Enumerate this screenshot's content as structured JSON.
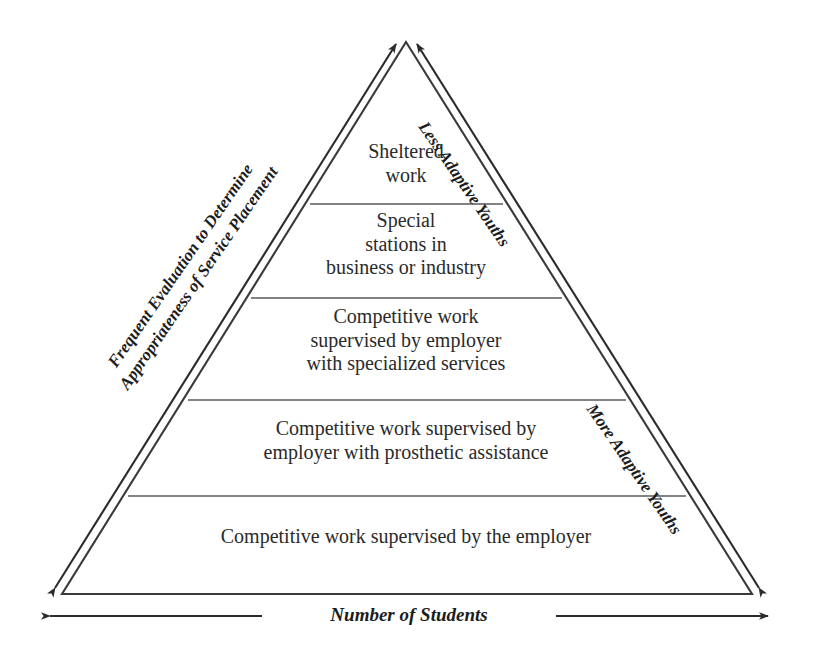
{
  "diagram": {
    "type": "pyramid",
    "title": "",
    "tiers": [
      {
        "id": "tier-1",
        "text": "Sheltered\nwork"
      },
      {
        "id": "tier-2",
        "text": "Special\nstations in\nbusiness or industry"
      },
      {
        "id": "tier-3",
        "text": "Competitive work\nsupervised by employer\nwith specialized services"
      },
      {
        "id": "tier-4",
        "text": "Competitive work supervised by\nemployer with prosthetic assistance"
      },
      {
        "id": "tier-5",
        "text": "Competitive work supervised by the employer"
      }
    ],
    "labels": {
      "left_axis": "Frequent Evaluation to Determine\nAppropriateness of Service Placement",
      "right_top": "Less Adaptive Youths",
      "right_bottom": "More Adaptive Youths",
      "bottom_axis": "Number of Students"
    },
    "colors": {
      "line": "#3a3a3a",
      "text": "#2a2a2a",
      "background": "#ffffff",
      "divider": "#555555"
    }
  }
}
